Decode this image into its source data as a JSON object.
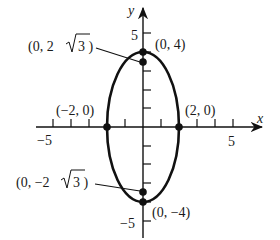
{
  "diagram": {
    "type": "ellipse-graph",
    "equation_shape": "vertical ellipse centered at origin",
    "axes": {
      "x_label": "x",
      "y_label": "y",
      "x_tick_labels": [
        {
          "value": -5,
          "text": "−5"
        },
        {
          "value": 5,
          "text": "5"
        }
      ],
      "y_tick_labels": [
        {
          "value": 5,
          "text": "5"
        },
        {
          "value": -5,
          "text": "−5"
        }
      ],
      "x_range": [
        -5.5,
        5.5
      ],
      "y_range": [
        -5.5,
        5.5
      ]
    },
    "ellipse": {
      "center": [
        0,
        0
      ],
      "a": 2,
      "b": 4
    },
    "points": [
      {
        "id": "top-vertex",
        "coords": [
          0,
          4
        ],
        "label": "(0, 4)"
      },
      {
        "id": "bottom-vertex",
        "coords": [
          0,
          -4
        ],
        "label": "(0, −4)"
      },
      {
        "id": "left-vertex",
        "coords": [
          -2,
          0
        ],
        "label": "(−2, 0)"
      },
      {
        "id": "right-vertex",
        "coords": [
          2,
          0
        ],
        "label": "(2, 0)"
      },
      {
        "id": "upper-focus",
        "coords": [
          0,
          3.464
        ],
        "label_prefix": "(0, 2",
        "label_radical": "3",
        "label_suffix": " )"
      },
      {
        "id": "lower-focus",
        "coords": [
          0,
          -3.464
        ],
        "label_prefix": "(0, −2",
        "label_radical": "3",
        "label_suffix": " )"
      }
    ],
    "colors": {
      "stroke": "#111111",
      "background": "#ffffff"
    }
  }
}
